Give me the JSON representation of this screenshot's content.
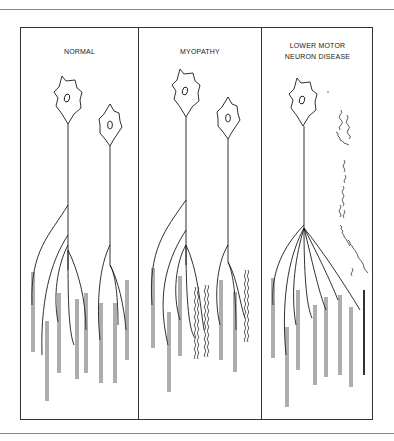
{
  "figure": {
    "panels": [
      {
        "id": "normal",
        "title_lines": [
          "NORMAL"
        ]
      },
      {
        "id": "myopathy",
        "title_lines": [
          "MYOPATHY"
        ]
      },
      {
        "id": "lmnd",
        "title_lines": [
          "LOWER MOTOR",
          "NEURON DISEASE"
        ]
      }
    ]
  },
  "colors": {
    "line": "#1a1a1a",
    "border": "#333333",
    "rule": "#8a8a8a",
    "background": "#ffffff"
  }
}
